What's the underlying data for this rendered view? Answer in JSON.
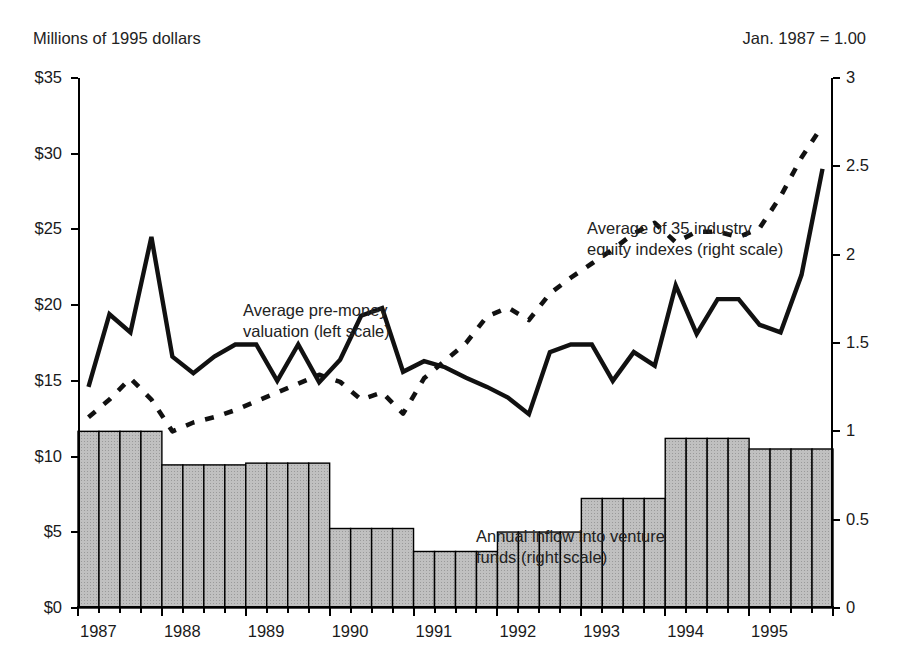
{
  "header": {
    "left_label": "Millions of 1995 dollars",
    "right_label": "Jan. 1987 = 1.00"
  },
  "annotations": {
    "valuation_line1": "Average pre-money",
    "valuation_line2": "valuation (left scale)",
    "equity_line1": "Average of 35 industry",
    "equity_line2": "equity indexes (right scale)",
    "inflow_line1": "Annual inflow into venture",
    "inflow_line2": "funds (right scale)"
  },
  "colors": {
    "line": "#111111",
    "bar_fill": "#c0c0c0",
    "bar_stroke": "#000000",
    "text": "#222222"
  },
  "axes": {
    "left_ticks": [
      "$0",
      "$5",
      "$10",
      "$15",
      "$20",
      "$25",
      "$30",
      "$35"
    ],
    "left_values": [
      0,
      5,
      10,
      15,
      20,
      25,
      30,
      35
    ],
    "right_ticks": [
      "0",
      "0.5",
      "1",
      "1.5",
      "2",
      "2.5",
      "3"
    ],
    "right_values": [
      0,
      0.5,
      1,
      1.5,
      2,
      2.5,
      3
    ],
    "x_ticks": [
      "1987",
      "1988",
      "1989",
      "1990",
      "1991",
      "1992",
      "1993",
      "1994",
      "1995"
    ]
  },
  "chart_data": {
    "type": "line",
    "title": "",
    "subtitle": "",
    "xlabel": "",
    "ylabel": "Millions of 1995 dollars",
    "y2label": "Jan. 1987 = 1.00",
    "ylim": [
      0,
      35
    ],
    "y2lim": [
      0,
      3
    ],
    "grid": false,
    "legend_position": "inline-annotations",
    "x": [
      "1987Q1",
      "1987Q2",
      "1987Q3",
      "1987Q4",
      "1988Q1",
      "1988Q2",
      "1988Q3",
      "1988Q4",
      "1989Q1",
      "1989Q2",
      "1989Q3",
      "1989Q4",
      "1990Q1",
      "1990Q2",
      "1990Q3",
      "1990Q4",
      "1991Q1",
      "1991Q2",
      "1991Q3",
      "1991Q4",
      "1992Q1",
      "1992Q2",
      "1992Q3",
      "1992Q4",
      "1993Q1",
      "1993Q2",
      "1993Q3",
      "1993Q4",
      "1994Q1",
      "1994Q2",
      "1994Q3",
      "1994Q4",
      "1995Q1",
      "1995Q2",
      "1995Q3",
      "1995Q4"
    ],
    "x_tick_labels": [
      "1987",
      "1988",
      "1989",
      "1990",
      "1991",
      "1992",
      "1993",
      "1994",
      "1995"
    ],
    "series": [
      {
        "name": "Average pre-money valuation (left scale)",
        "axis": "left",
        "style": "solid",
        "units": "millions of 1995 dollars",
        "values": [
          14.6,
          19.4,
          18.2,
          24.5,
          16.6,
          15.5,
          16.6,
          17.4,
          17.4,
          15.0,
          17.4,
          14.9,
          16.4,
          19.3,
          19.8,
          15.6,
          16.3,
          15.9,
          15.2,
          14.6,
          13.9,
          12.8,
          16.9,
          17.4,
          17.4,
          15.0,
          16.9,
          16.0,
          21.3,
          18.1,
          20.4,
          20.4,
          18.7,
          18.2,
          22.0,
          29.0
        ]
      },
      {
        "name": "Average of 35 industry equity indexes (right scale)",
        "axis": "right",
        "style": "dashed",
        "units": "index, Jan. 1987 = 1.00",
        "values": [
          1.08,
          1.18,
          1.3,
          1.18,
          1.0,
          1.05,
          1.08,
          1.12,
          1.17,
          1.22,
          1.27,
          1.32,
          1.28,
          1.18,
          1.22,
          1.1,
          1.3,
          1.4,
          1.5,
          1.65,
          1.7,
          1.63,
          1.78,
          1.87,
          1.95,
          2.03,
          2.12,
          2.18,
          2.07,
          2.13,
          2.13,
          2.1,
          2.15,
          2.33,
          2.55,
          2.73
        ]
      }
    ],
    "bars": {
      "name": "Annual inflow into venture funds (right scale)",
      "axis": "right",
      "units": "index, Jan. 1987 = 1.00",
      "values": [
        1.0,
        1.0,
        1.0,
        1.0,
        0.81,
        0.81,
        0.81,
        0.81,
        0.82,
        0.82,
        0.82,
        0.82,
        0.45,
        0.45,
        0.45,
        0.45,
        0.32,
        0.32,
        0.32,
        0.32,
        0.43,
        0.43,
        0.43,
        0.43,
        0.62,
        0.62,
        0.62,
        0.62,
        0.96,
        0.96,
        0.96,
        0.96,
        0.9,
        0.9,
        0.9,
        0.9
      ],
      "left_scale_equivalent": [
        11.7,
        11.7,
        11.7,
        11.7,
        9.45,
        9.45,
        9.45,
        9.45,
        9.6,
        9.6,
        9.6,
        9.6,
        5.2,
        5.2,
        5.2,
        5.2,
        3.7,
        3.7,
        3.7,
        3.7,
        5.0,
        5.0,
        5.0,
        5.0,
        7.2,
        7.2,
        7.2,
        7.2,
        11.2,
        11.2,
        11.2,
        11.2,
        10.5,
        10.5,
        10.5,
        10.5
      ]
    }
  }
}
